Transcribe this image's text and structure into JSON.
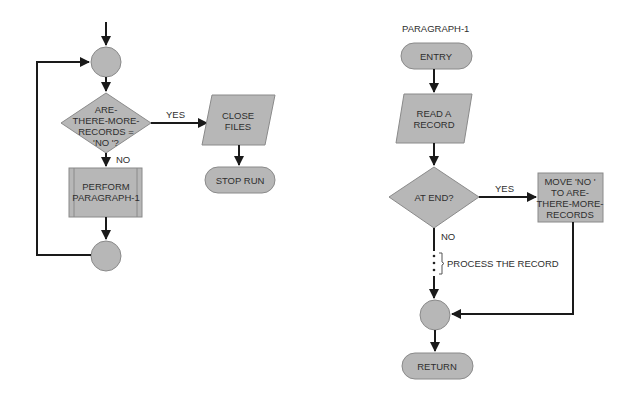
{
  "colors": {
    "shape_fill": "#b7b7b7",
    "shape_stroke": "#8a8a8a",
    "line": "#1a1a1a",
    "text": "#2e2e2e",
    "background": "#ffffff"
  },
  "main_flow": {
    "decision": {
      "lines": [
        "ARE-",
        "THERE-MORE-",
        "RECORDS =",
        "'NO '?"
      ]
    },
    "yes_label": "YES",
    "no_label": "NO",
    "perform": {
      "lines": [
        "PERFORM",
        "PARAGRAPH-1"
      ]
    },
    "close_files": {
      "lines": [
        "CLOSE",
        "FILES"
      ]
    },
    "stop_run": "STOP RUN"
  },
  "paragraph_flow": {
    "title": "PARAGRAPH-1",
    "entry": "ENTRY",
    "read_record": {
      "lines": [
        "READ A",
        "RECORD"
      ]
    },
    "decision": "AT END?",
    "yes_label": "YES",
    "no_label": "NO",
    "move": {
      "lines": [
        "MOVE 'NO '",
        "TO ARE-",
        "THERE-MORE-",
        "RECORDS"
      ]
    },
    "process_note": "PROCESS THE RECORD",
    "return": "RETURN"
  }
}
